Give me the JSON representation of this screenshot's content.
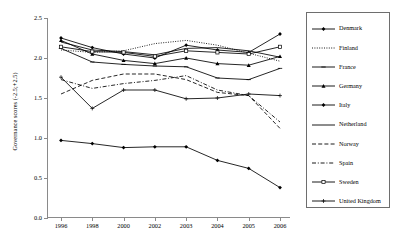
{
  "chart_data": {
    "type": "line",
    "title": "",
    "xlabel": "",
    "ylabel": "Governance scores (-2.5;+2.5)",
    "categories": [
      "1996",
      "1998",
      "2000",
      "2002",
      "2003",
      "2004",
      "2005",
      "2006"
    ],
    "ylim": [
      0.0,
      2.5
    ],
    "yticks": [
      0.0,
      0.5,
      1.0,
      1.5,
      2.0,
      2.5
    ],
    "ytick_labels": [
      "0.0",
      "0.5",
      "1.0",
      "1.5",
      "2.0",
      "2.5"
    ],
    "grid": false,
    "legend_position": "right",
    "series": [
      {
        "name": "Denmark",
        "style": "solid",
        "marker": "diamond",
        "values": [
          2.25,
          2.13,
          2.05,
          2.0,
          2.16,
          2.1,
          2.07,
          2.3
        ]
      },
      {
        "name": "Finland",
        "style": "dotted",
        "marker": "none",
        "values": [
          2.1,
          2.07,
          2.09,
          2.18,
          2.22,
          2.16,
          2.06,
          1.96
        ]
      },
      {
        "name": "France",
        "style": "solid",
        "marker": "line",
        "values": [
          2.12,
          1.95,
          1.92,
          1.9,
          1.89,
          1.75,
          1.73,
          1.87
        ]
      },
      {
        "name": "Germany",
        "style": "solid",
        "marker": "triangle",
        "values": [
          2.22,
          2.05,
          1.97,
          1.93,
          2.0,
          1.93,
          1.91,
          2.02
        ]
      },
      {
        "name": "Italy",
        "style": "solid",
        "marker": "diamond",
        "values": [
          0.97,
          0.93,
          0.88,
          0.89,
          0.89,
          0.72,
          0.62,
          0.38
        ]
      },
      {
        "name": "Netherland",
        "style": "solid",
        "marker": "none",
        "values": [
          2.2,
          2.1,
          2.08,
          2.04,
          2.12,
          2.13,
          2.09,
          2.01
        ]
      },
      {
        "name": "Norway",
        "style": "dashed",
        "marker": "none",
        "values": [
          1.55,
          1.72,
          1.8,
          1.8,
          1.73,
          1.57,
          1.53,
          1.12
        ]
      },
      {
        "name": "Spain",
        "style": "dashdot",
        "marker": "none",
        "values": [
          1.73,
          1.62,
          1.68,
          1.72,
          1.78,
          1.6,
          1.53,
          1.2
        ]
      },
      {
        "name": "Sweden",
        "style": "solid",
        "marker": "square",
        "values": [
          2.14,
          2.08,
          2.07,
          2.02,
          2.09,
          2.07,
          2.05,
          2.14
        ]
      },
      {
        "name": "United Kingdom",
        "style": "solid",
        "marker": "cross",
        "values": [
          1.76,
          1.37,
          1.6,
          1.6,
          1.49,
          1.5,
          1.55,
          1.53
        ]
      }
    ]
  },
  "legend": {
    "items": [
      {
        "label": "Denmark"
      },
      {
        "label": "Finland"
      },
      {
        "label": "France"
      },
      {
        "label": "Germany"
      },
      {
        "label": "Italy"
      },
      {
        "label": "Netherland"
      },
      {
        "label": "Norway"
      },
      {
        "label": "Spain"
      },
      {
        "label": "Sweden"
      },
      {
        "label": "United Kingdom"
      }
    ]
  },
  "colors": {
    "line": "#000000",
    "axis": "#8a8a8a",
    "legend_border": "#6e6e6e",
    "background": "#ffffff"
  }
}
